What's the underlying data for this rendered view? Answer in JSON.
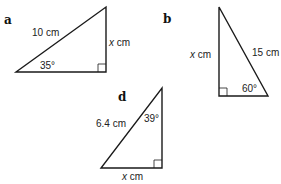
{
  "figures": [
    {
      "id": "a",
      "label": "a",
      "hypotenuse": "10 cm",
      "opposite_var": "x",
      "opposite_unit": " cm",
      "angle": "35°"
    },
    {
      "id": "b",
      "label": "b",
      "hypotenuse": "15 cm",
      "adjacent_var": "x",
      "adjacent_unit": " cm",
      "angle": "60°"
    },
    {
      "id": "d",
      "label": "d",
      "hypotenuse": "6.4 cm",
      "base_var": "x",
      "base_unit": " cm",
      "angle": "39°"
    }
  ]
}
